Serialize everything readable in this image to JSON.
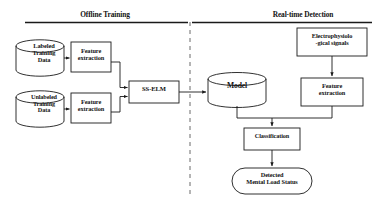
{
  "figure": {
    "type": "flowchart",
    "background": "#ffffff",
    "stroke_color": "#1a1a1a",
    "divider": {
      "style": "dashed",
      "x": 190,
      "orientation": "vertical"
    }
  },
  "headers": {
    "offline": "Offline Training",
    "realtime": "Real-time Detection"
  },
  "nodes": {
    "labeled_data": {
      "label": "Labeled\nTraining\nData",
      "shape": "cylinder"
    },
    "unlabeled_data": {
      "label": "Unlabeled\nTraining\nData",
      "shape": "cylinder"
    },
    "feature_extraction_labeled": {
      "label": "Feature\nextraction",
      "shape": "rectangle"
    },
    "feature_extraction_unlabeled": {
      "label": "Feature\nextraction",
      "shape": "rectangle"
    },
    "ss_elm": {
      "label": "SS-ELM",
      "shape": "rectangle"
    },
    "model": {
      "label": "Model",
      "shape": "cylinder"
    },
    "electrophysiological_signals": {
      "label": "Electrophysiolo\n-gical signals",
      "shape": "rectangle"
    },
    "feature_extraction_realtime": {
      "label": "Feature\nextraction",
      "shape": "rectangle"
    },
    "classification": {
      "label": "Classification",
      "shape": "rectangle"
    },
    "detected_mental_load_status": {
      "label": "Detected\nMental Load Status",
      "shape": "rounded-oval"
    }
  },
  "edges": [
    {
      "from": "labeled_data",
      "to": "feature_extraction_labeled",
      "arrow": true
    },
    {
      "from": "unlabeled_data",
      "to": "feature_extraction_unlabeled",
      "arrow": true
    },
    {
      "from": "feature_extraction_labeled",
      "to": "ss_elm",
      "arrow": true
    },
    {
      "from": "feature_extraction_unlabeled",
      "to": "ss_elm",
      "arrow": true
    },
    {
      "from": "ss_elm",
      "to": "model",
      "arrow": true
    },
    {
      "from": "electrophysiological_signals",
      "to": "feature_extraction_realtime",
      "arrow": true
    },
    {
      "from": "model",
      "to": "classification",
      "arrow": true
    },
    {
      "from": "feature_extraction_realtime",
      "to": "classification",
      "arrow": true
    },
    {
      "from": "classification",
      "to": "detected_mental_load_status",
      "arrow": true
    }
  ]
}
